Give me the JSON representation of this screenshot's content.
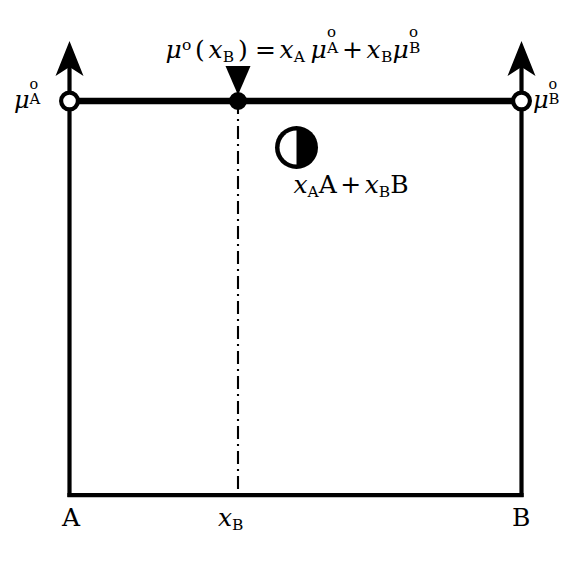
{
  "figure": {
    "kind": "thermodynamic-mixing-diagram",
    "background_color": "#ffffff",
    "line_color": "#000000",
    "equation": {
      "text": "μ°(x_B) = x_A μ°_A + x_B μ°_B",
      "plain": "mu0(xB) = xA mu0A + xB mu0B"
    },
    "labels": {
      "mu_a": "μ°_A",
      "mu_b": "μ°_B",
      "mixture": "x_A A + x_B B",
      "axis_left": "A",
      "axis_center": "x_B",
      "axis_right": "B"
    },
    "markers": {
      "left_endpoint": "open-circle",
      "right_endpoint": "open-circle",
      "midpoint": "filled-circle"
    },
    "arrows": {
      "left_axis": "up-arrow",
      "right_axis": "up-arrow",
      "pointer_to_midpoint": "down-arrow"
    },
    "icon": {
      "name": "half-filled-circle",
      "description": "black circle with white left half"
    },
    "geometry": {
      "box_left_x": 69,
      "box_right_x": 521,
      "top_line_y": 101,
      "bottom_line_y": 497,
      "midpoint_x": 238,
      "left_arrow_tip_y": 44,
      "right_arrow_tip_y": 44,
      "down_arrow_top_y": 66,
      "dash_line_bottom_y": 497
    }
  }
}
